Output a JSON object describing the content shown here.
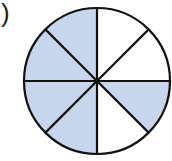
{
  "label": ")",
  "diagram": {
    "type": "fraction-circle",
    "total_sectors": 8,
    "shaded_sectors": 5,
    "sectors_clockwise_from_top": [
      false,
      false,
      true,
      false,
      true,
      true,
      true,
      true
    ],
    "shade_color": "#c7d6ec",
    "line_color": "#111111"
  }
}
